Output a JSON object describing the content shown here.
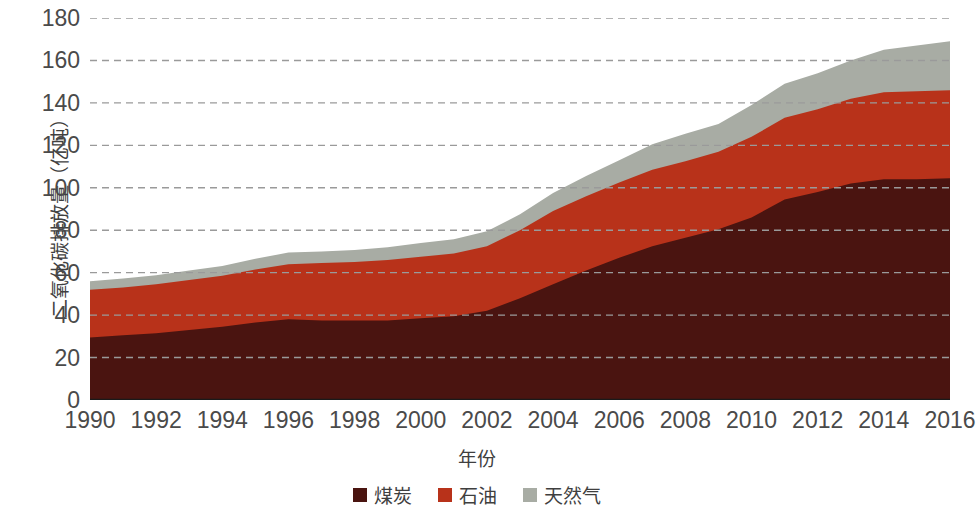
{
  "chart_data": {
    "type": "area",
    "stacked": true,
    "title": "",
    "xlabel": "年份",
    "ylabel": "二氧化碳排放量（亿吨）",
    "x": [
      1990,
      1991,
      1992,
      1993,
      1994,
      1995,
      1996,
      1997,
      1998,
      1999,
      2000,
      2001,
      2002,
      2003,
      2004,
      2005,
      2006,
      2007,
      2008,
      2009,
      2010,
      2011,
      2012,
      2013,
      2014,
      2015,
      2016
    ],
    "xlim": [
      1990,
      2016
    ],
    "ylim": [
      0,
      180
    ],
    "yticks": [
      0,
      20,
      40,
      60,
      80,
      100,
      120,
      140,
      160,
      180
    ],
    "xticks": [
      1990,
      1992,
      1994,
      1996,
      1998,
      2000,
      2002,
      2004,
      2006,
      2008,
      2010,
      2012,
      2014,
      2016
    ],
    "grid": "horizontal-dashed",
    "legend_position": "bottom",
    "series": [
      {
        "name": "煤炭",
        "color": "#4a1410",
        "values": [
          29.5,
          30.5,
          31.5,
          33.0,
          34.5,
          36.5,
          38.0,
          37.5,
          37.5,
          37.5,
          38.5,
          39.5,
          42.0,
          48.0,
          54.5,
          61.0,
          67.0,
          72.5,
          76.5,
          80.5,
          86.0,
          94.5,
          98.0,
          102.0,
          104.0,
          104.0,
          104.5
        ]
      },
      {
        "name": "石油",
        "color": "#b8321a",
        "values": [
          22.5,
          22.5,
          23.0,
          23.5,
          24.0,
          25.0,
          26.0,
          27.0,
          27.5,
          28.5,
          29.0,
          29.5,
          30.5,
          32.0,
          34.5,
          35.0,
          35.5,
          36.0,
          36.0,
          36.5,
          38.0,
          38.5,
          39.0,
          40.0,
          41.0,
          41.5,
          41.5
        ]
      },
      {
        "name": "天然气",
        "color": "#a8aca4",
        "values": [
          4.0,
          4.2,
          4.3,
          4.5,
          4.7,
          5.0,
          5.5,
          5.5,
          5.7,
          6.0,
          6.5,
          6.7,
          7.0,
          7.5,
          8.5,
          9.5,
          10.5,
          12.0,
          13.0,
          13.0,
          15.0,
          16.0,
          17.0,
          18.0,
          20.0,
          21.5,
          23.0
        ]
      }
    ],
    "totals": [
      56.0,
      57.2,
      58.8,
      61.0,
      63.2,
      66.5,
      69.5,
      70.0,
      70.7,
      72.0,
      74.0,
      75.7,
      79.5,
      87.5,
      97.5,
      105.5,
      113.0,
      120.5,
      125.5,
      130.0,
      139.0,
      149.0,
      154.0,
      160.0,
      165.0,
      167.0,
      169.0
    ]
  },
  "legend": {
    "items": [
      {
        "label": "煤炭",
        "color": "#4a1410"
      },
      {
        "label": "石油",
        "color": "#b8321a"
      },
      {
        "label": "天然气",
        "color": "#a8aca4"
      }
    ]
  },
  "axes": {
    "y_title": "二氧化碳排放量（亿吨）",
    "x_title": "年份",
    "y_tick_labels": [
      "180",
      "160",
      "140",
      "120",
      "100",
      "80",
      "60",
      "40",
      "20",
      "0"
    ],
    "x_tick_labels": [
      "1990",
      "1992",
      "1994",
      "1996",
      "1998",
      "2000",
      "2002",
      "2004",
      "2006",
      "2008",
      "2010",
      "2012",
      "2014",
      "2016"
    ]
  },
  "style": {
    "grid_color": "#9a9a9a",
    "axis_line_color": "#1a1a1a",
    "text_color": "#4a4a4a",
    "background": "#ffffff"
  }
}
